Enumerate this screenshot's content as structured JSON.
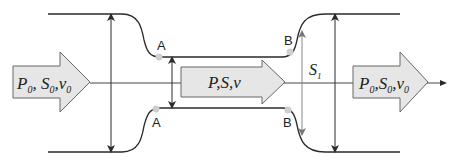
{
  "diagram": {
    "type": "pipe-constriction-flow",
    "labels": {
      "inlet": {
        "P": "P",
        "S": "S",
        "v": "v",
        "sub": "0"
      },
      "throat": {
        "text": "P,S,v"
      },
      "outlet": {
        "P": "P",
        "S": "S",
        "v": "v",
        "sub": "0"
      },
      "section": {
        "S": "S",
        "sub": "1"
      }
    },
    "points": {
      "A_top": "A",
      "A_bottom": "A",
      "B_top": "B",
      "B_bottom": "B"
    },
    "colors": {
      "stroke": "#2a2a2a",
      "arrow_fill": "#e6e6e6",
      "arrow_stroke": "#666666",
      "point": "#cfcfcf",
      "gray_line": "#888888"
    }
  }
}
